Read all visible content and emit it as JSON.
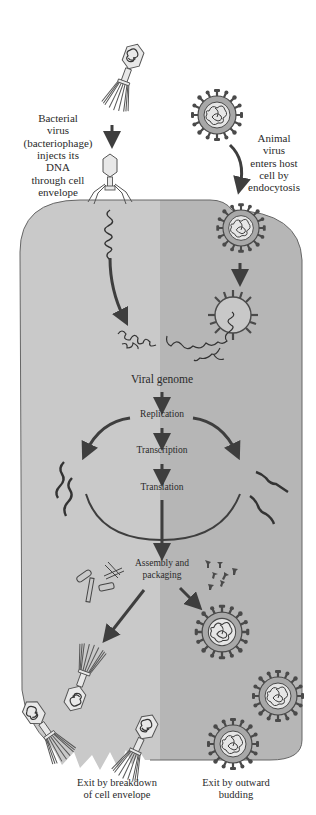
{
  "diagram": {
    "colors": {
      "background": "#ffffff",
      "cell_left": "#c9c9c9",
      "cell_right": "#b6b6b6",
      "outline": "#555555",
      "arrow": "#3e3e3e",
      "virus_envelope": "#a8a8a8",
      "virus_spike": "#4a4a4a",
      "capsid_fill": "#e8e8e8",
      "text": "#2a2a2a"
    },
    "labels": {
      "bacterial_entry": [
        "Bacterial",
        "virus",
        "(bacteriophage)",
        "injects its",
        "DNA",
        "through cell",
        "envelope"
      ],
      "animal_entry": [
        "Animal",
        "virus",
        "enters host",
        "cell by",
        "endocytosis"
      ],
      "exit_bacterial": [
        "Exit by breakdown",
        "of cell envelope"
      ],
      "exit_animal": [
        "Exit by outward",
        "budding"
      ]
    },
    "steps": [
      {
        "id": "viral-genome",
        "label": "Viral genome"
      },
      {
        "id": "replication",
        "label": "Replication"
      },
      {
        "id": "transcription",
        "label": "Transcription"
      },
      {
        "id": "translation",
        "label": "Translation"
      },
      {
        "id": "assembly",
        "label": "Assembly and"
      },
      {
        "id": "packaging",
        "label": "packaging"
      }
    ],
    "icons": {
      "bacteriophage": "bacteriophage-icon",
      "animal_virus": "enveloped-virus-icon",
      "dna_strand": "dna-strand-icon",
      "rna_strand": "rna-strand-icon",
      "capsid_parts": "capsid-parts-icon",
      "spike_proteins": "spike-protein-icon"
    }
  }
}
